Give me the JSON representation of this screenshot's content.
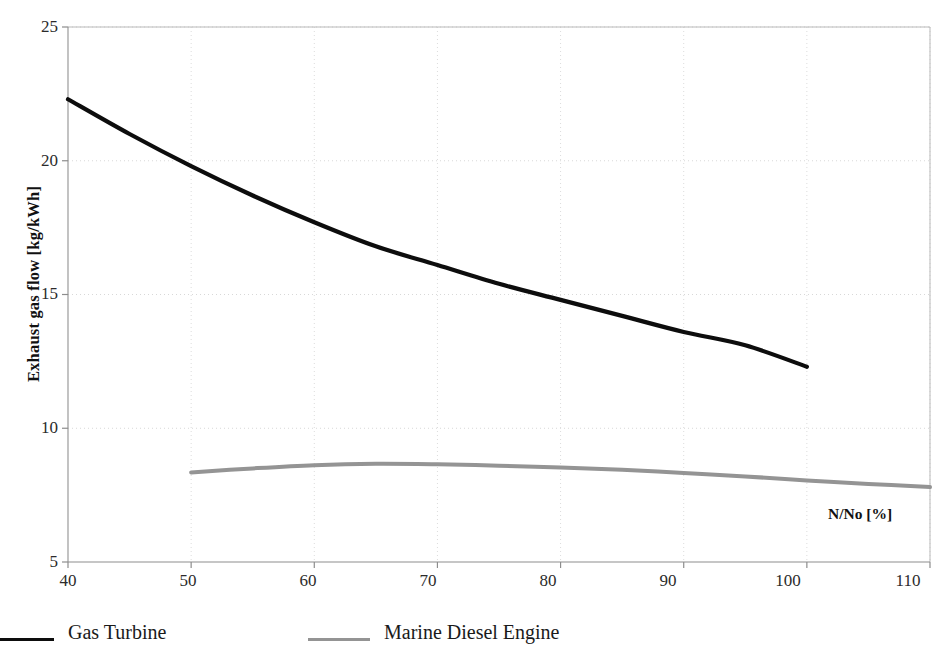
{
  "chart_data": {
    "type": "line",
    "title": "",
    "subtitle": "",
    "xlabel": "N/No  [%]",
    "ylabel": "Exhaust gas flow [kg/kWh]",
    "xlim": [
      40,
      110
    ],
    "ylim": [
      5,
      25
    ],
    "xticks": [
      40,
      50,
      60,
      70,
      80,
      90,
      100,
      110
    ],
    "yticks": [
      5,
      10,
      15,
      20,
      25
    ],
    "grid": true,
    "legend_position": "below-plot",
    "series": [
      {
        "name": "Gas Turbine",
        "color": "#0d0d0d",
        "x": [
          40,
          45,
          50,
          55,
          60,
          65,
          70,
          75,
          80,
          85,
          90,
          95,
          100
        ],
        "values": [
          22.3,
          21.0,
          19.8,
          18.7,
          17.7,
          16.8,
          16.1,
          15.4,
          14.8,
          14.2,
          13.6,
          13.1,
          12.3
        ]
      },
      {
        "name": "Marine Diesel Engine",
        "color": "#949494",
        "x": [
          50,
          55,
          60,
          65,
          70,
          75,
          80,
          85,
          90,
          95,
          100,
          105,
          110
        ],
        "values": [
          8.35,
          8.5,
          8.62,
          8.67,
          8.65,
          8.6,
          8.53,
          8.45,
          8.33,
          8.2,
          8.05,
          7.92,
          7.8
        ]
      }
    ]
  },
  "axes": {
    "y_title": "Exhaust gas flow [kg/kWh]",
    "x_annotation": "N/No  [%]",
    "ytick_labels": [
      "25",
      "20",
      "15",
      "10",
      "5"
    ],
    "xtick_labels": [
      "40",
      "50",
      "60",
      "70",
      "80",
      "90",
      "100",
      "110"
    ]
  },
  "legend": {
    "entries": [
      {
        "label": "Gas Turbine",
        "color": "#0d0d0d"
      },
      {
        "label": "Marine Diesel Engine",
        "color": "#949494"
      }
    ]
  }
}
